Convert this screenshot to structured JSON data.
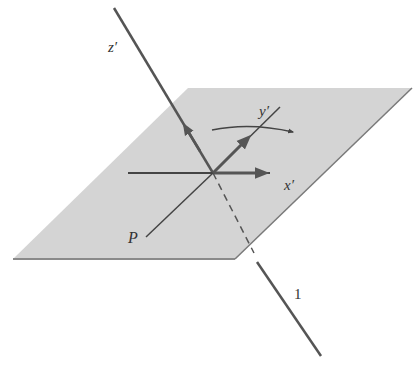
{
  "diagram": {
    "type": "3d-coordinate-rotation",
    "colors": {
      "plane_fill": "#d4d4d4",
      "plane_edge": "#8a8a8a",
      "line": "#555555",
      "text": "#333333",
      "background": "#ffffff"
    },
    "labels": {
      "z_axis": "z′",
      "y_axis": "y′",
      "x_axis": "x′",
      "point_p": "P",
      "line_1": "1"
    },
    "elements": {
      "plane": "shaded parallelogram plane",
      "z_axis": "axis z′ pointing up-left, piercing the plane",
      "x_axis": "axis x′ horizontal in plane with arrow to the right",
      "y_axis": "axis y′ diagonal in plane with arrow up-right",
      "line_p": "line from P through origin (continuation of y′ direction)",
      "rotation_arrow": "curved arrow indicating rotation about z′",
      "line_1": "line 1, continuation of z′ axis below the plane (dashed beneath, solid outside)"
    }
  }
}
